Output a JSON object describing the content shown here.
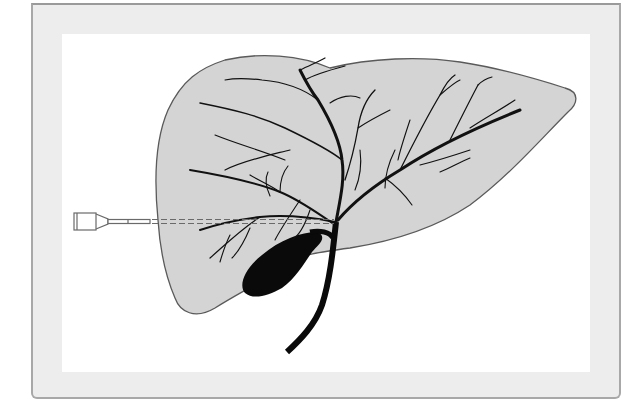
{
  "figure": {
    "colors": {
      "frame_background": "#ededed",
      "frame_border": "#a8a8a8",
      "panel_background": "#ffffff",
      "liver_fill": "#d4d4d4",
      "liver_outline": "#5a5a5a",
      "ducts": "#111111",
      "gallbladder": "#0a0a0a",
      "needle": "#666666"
    },
    "elements": [
      {
        "name": "liver",
        "icon": "liver-shape"
      },
      {
        "name": "biliary-tree",
        "icon": "branching-ducts"
      },
      {
        "name": "gallbladder",
        "icon": "gallbladder-shape"
      },
      {
        "name": "common-bile-duct",
        "icon": "duct-curve"
      },
      {
        "name": "needle",
        "icon": "syringe-needle"
      },
      {
        "name": "needle-track",
        "icon": "dashed-line"
      }
    ]
  }
}
